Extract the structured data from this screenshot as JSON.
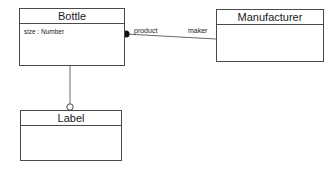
{
  "diagram": {
    "type": "uml-class-diagram",
    "background_color": "#ffffff",
    "line_color": "#6a6a6a",
    "border_color": "#4a4a4a",
    "text_color": "#1a1a1a",
    "classes": [
      {
        "id": "bottle",
        "name": "Bottle",
        "attributes": [
          "size : Number"
        ],
        "operations": []
      },
      {
        "id": "manufacturer",
        "name": "Manufacturer",
        "attributes": [],
        "operations": []
      },
      {
        "id": "label",
        "name": "Label",
        "attributes": [],
        "operations": []
      }
    ],
    "relationships": [
      {
        "id": "bottle-manufacturer",
        "from": "bottle",
        "to": "manufacturer",
        "source_marker": "filled-dot",
        "target_marker": "none",
        "source_role": "product",
        "target_role": "maker"
      },
      {
        "id": "bottle-label",
        "from": "bottle",
        "to": "label",
        "source_marker": "none",
        "target_marker": "hollow-circle",
        "source_role": "",
        "target_role": ""
      }
    ]
  }
}
